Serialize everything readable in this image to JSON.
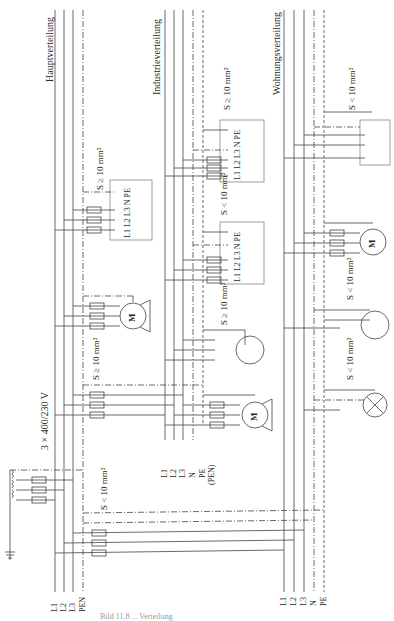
{
  "titles": {
    "haupt": "Hauptverteilung",
    "industrie": "Industrieverteilung",
    "wohnung": "Wohnungsverteilung"
  },
  "supply_voltage": "3 × 400/230 V",
  "cross_sections": {
    "ge10": "S ≥ 10 mm²",
    "lt10": "S < 10 mm²"
  },
  "terminal_labels": "L1 L2 L3 N PE",
  "motor_label": "M",
  "bus_labels": {
    "haupt": [
      "L1",
      "L2",
      "L3",
      "PEN"
    ],
    "industrie": [
      "L1",
      "L2",
      "L3",
      "N",
      "PE",
      "(PEN)"
    ],
    "wohnung": [
      "L1",
      "L2",
      "L3",
      "N",
      "PE"
    ]
  },
  "icons": {
    "motor": "motor-symbol",
    "lamp": "lamp-symbol",
    "fuse": "fuse-symbol",
    "switch": "switch-symbol",
    "socket": "socket-symbol",
    "ground": "ground-symbol",
    "transformer": "transformer-coil-symbol"
  },
  "caption": "Bild 11.8 ... Verteilung"
}
